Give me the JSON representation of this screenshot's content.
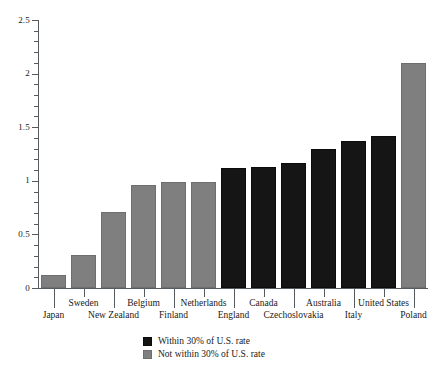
{
  "chart_data": {
    "type": "bar",
    "title": "",
    "subtitle": "",
    "xlabel": "",
    "ylabel": "",
    "ylim": [
      0,
      2.5
    ],
    "yticks": [
      0,
      0.5,
      1,
      1.5,
      2,
      2.5
    ],
    "ytick_labels": [
      "0",
      "0.5",
      "1",
      "1.5",
      "2",
      "2.5"
    ],
    "yminor_step": 0.1,
    "grid": false,
    "legend_position": "bottom-center",
    "categories": [
      "Japan",
      "Sweden",
      "New Zealand",
      "Belgium",
      "Finland",
      "Netherlands",
      "England",
      "Canada",
      "Czechoslovakia",
      "Australia",
      "Italy",
      "United States",
      "Poland"
    ],
    "values": [
      0.12,
      0.31,
      0.71,
      0.96,
      0.99,
      0.99,
      1.12,
      1.13,
      1.17,
      1.3,
      1.37,
      1.42,
      2.1
    ],
    "groups": [
      "not-within",
      "not-within",
      "not-within",
      "not-within",
      "not-within",
      "not-within",
      "within",
      "within",
      "within",
      "within",
      "within",
      "within",
      "not-within"
    ],
    "label_rows": [
      "bottom",
      "top",
      "bottom",
      "top",
      "bottom",
      "top",
      "bottom",
      "top",
      "bottom",
      "top",
      "bottom",
      "top",
      "bottom"
    ],
    "series": [
      {
        "name": "Within 30% of U.S. rate",
        "key": "within",
        "color": "#151515"
      },
      {
        "name": "Not within 30% of U.S. rate",
        "key": "not-within",
        "color": "#7f7f7f"
      }
    ]
  },
  "legend": {
    "items": [
      {
        "label": "Within 30% of U.S. rate",
        "swatch": "dark"
      },
      {
        "label": "Not within 30% of U.S. rate",
        "swatch": "gray"
      }
    ]
  },
  "colors": {
    "within_30": "#151515",
    "not_within_30": "#7f7f7f",
    "axis": "#555a5e",
    "text": "#1a1a1a",
    "background": "#ffffff"
  }
}
